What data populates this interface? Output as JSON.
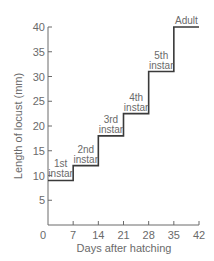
{
  "chart_data": {
    "type": "line",
    "style": "step",
    "title": "",
    "xlabel": "Days after hatching",
    "ylabel": "Length of locust (mm)",
    "xlim": [
      0,
      42
    ],
    "ylim": [
      0,
      40
    ],
    "x_ticks": [
      0,
      7,
      14,
      21,
      28,
      35,
      42
    ],
    "y_ticks": [
      5,
      10,
      15,
      20,
      25,
      30,
      35,
      40
    ],
    "y_zero_label": "0",
    "grid": false,
    "legend": null,
    "series": [
      {
        "name": "Locust length",
        "steps": [
          {
            "x_start": 0,
            "x_end": 7,
            "y": 9,
            "label": "1st instar"
          },
          {
            "x_start": 7,
            "x_end": 14,
            "y": 12,
            "label": "2nd instar"
          },
          {
            "x_start": 14,
            "x_end": 21,
            "y": 18,
            "label": "3rd instar"
          },
          {
            "x_start": 21,
            "x_end": 28,
            "y": 22.5,
            "label": "4th instar"
          },
          {
            "x_start": 28,
            "x_end": 35,
            "y": 31,
            "label": "5th instar"
          },
          {
            "x_start": 35,
            "x_end": 42,
            "y": 40,
            "label": "Adult"
          }
        ]
      }
    ],
    "annotations": [
      {
        "text": [
          "1st",
          "instar"
        ],
        "x": 3.5
      },
      {
        "text": [
          "2nd",
          "instar"
        ],
        "x": 10.5
      },
      {
        "text": [
          "3rd",
          "instar"
        ],
        "x": 17.5
      },
      {
        "text": [
          "4th",
          "instar"
        ],
        "x": 24.5
      },
      {
        "text": [
          "5th",
          "instar"
        ],
        "x": 31.5
      },
      {
        "text": [
          "Adult"
        ],
        "x": 38.5
      }
    ],
    "colors": {
      "line": "#3a3a3a",
      "axis": "#6a6a6a",
      "text": "#6a6a6a"
    }
  }
}
